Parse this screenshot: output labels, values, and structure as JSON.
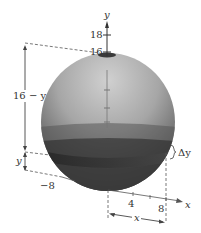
{
  "figure": {
    "type": "solid-of-revolution-sphere",
    "axes": {
      "y_label": "y",
      "x_label": "x",
      "y_ticks": [
        "18",
        "16"
      ],
      "x_ticks": [
        "4",
        "8"
      ],
      "neg_x_tick": "−8"
    },
    "dimensions": {
      "upper_height": "16 − y",
      "lower_height": "y",
      "slice_thickness": "Δy",
      "radius": "x"
    },
    "colors": {
      "sphere_light": "#bdbdbd",
      "sphere_mid": "#8a8a8a",
      "sphere_dark": "#2e2e2e",
      "line": "#555555",
      "background": "#ffffff"
    }
  }
}
